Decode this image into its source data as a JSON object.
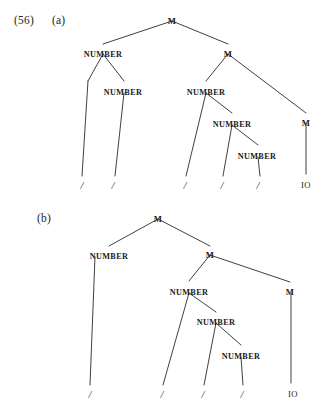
{
  "figure": {
    "example_number": "(56)",
    "background_color": "#ffffff",
    "ink_color": "#2b2b2b"
  },
  "trees": [
    {
      "label": "(a)",
      "label_pos": {
        "x": 52,
        "y": 14
      },
      "nodes": [
        {
          "name": "root-m",
          "text": "M",
          "x": 172,
          "y": 17
        },
        {
          "name": "number-1",
          "text": "NUMBER",
          "x": 103,
          "y": 50
        },
        {
          "name": "m-2",
          "text": "M",
          "x": 228,
          "y": 50
        },
        {
          "name": "number-2",
          "text": "NUMBER",
          "x": 123,
          "y": 88
        },
        {
          "name": "number-3",
          "text": "NUMBER",
          "x": 206,
          "y": 88
        },
        {
          "name": "m-3",
          "text": "M",
          "x": 306,
          "y": 119
        },
        {
          "name": "number-4",
          "text": "NUMBER",
          "x": 232,
          "y": 120
        },
        {
          "name": "number-5",
          "text": "NUMBER",
          "x": 257,
          "y": 152
        }
      ],
      "terminals": [
        {
          "name": "terminal-slash-1",
          "text": "/",
          "x": 82,
          "y": 180
        },
        {
          "name": "terminal-slash-2",
          "text": "/",
          "x": 113,
          "y": 180
        },
        {
          "name": "terminal-slash-3",
          "text": "/",
          "x": 185,
          "y": 180
        },
        {
          "name": "terminal-slash-4",
          "text": "/",
          "x": 222,
          "y": 180
        },
        {
          "name": "terminal-slash-5",
          "text": "/",
          "x": 258,
          "y": 180
        },
        {
          "name": "terminal-io",
          "text": "IO",
          "x": 306,
          "y": 180
        }
      ],
      "edges": [
        {
          "x1": 172,
          "y1": 21,
          "x2": 103,
          "y2": 44
        },
        {
          "x1": 172,
          "y1": 21,
          "x2": 228,
          "y2": 44
        },
        {
          "x1": 103,
          "y1": 54,
          "x2": 88,
          "y2": 81
        },
        {
          "x1": 103,
          "y1": 54,
          "x2": 124,
          "y2": 81
        },
        {
          "x1": 88,
          "y1": 81,
          "x2": 82,
          "y2": 176
        },
        {
          "x1": 124,
          "y1": 93,
          "x2": 115,
          "y2": 176
        },
        {
          "x1": 228,
          "y1": 54,
          "x2": 206,
          "y2": 81
        },
        {
          "x1": 228,
          "y1": 54,
          "x2": 306,
          "y2": 113
        },
        {
          "x1": 206,
          "y1": 93,
          "x2": 186,
          "y2": 176
        },
        {
          "x1": 206,
          "y1": 93,
          "x2": 232,
          "y2": 113
        },
        {
          "x1": 232,
          "y1": 125,
          "x2": 223,
          "y2": 176
        },
        {
          "x1": 232,
          "y1": 125,
          "x2": 258,
          "y2": 145
        },
        {
          "x1": 258,
          "y1": 157,
          "x2": 260,
          "y2": 176
        },
        {
          "x1": 306,
          "y1": 123,
          "x2": 306,
          "y2": 174
        }
      ]
    },
    {
      "label": "(b)",
      "label_pos": {
        "x": 37,
        "y": 212
      },
      "nodes": [
        {
          "name": "root-m",
          "text": "M",
          "x": 158,
          "y": 215
        },
        {
          "name": "number-1",
          "text": "NUMBER",
          "x": 109,
          "y": 252
        },
        {
          "name": "m-2",
          "text": "M",
          "x": 210,
          "y": 251
        },
        {
          "name": "number-2",
          "text": "NUMBER",
          "x": 189,
          "y": 288
        },
        {
          "name": "m-3",
          "text": "M",
          "x": 290,
          "y": 288
        },
        {
          "name": "number-3",
          "text": "NUMBER",
          "x": 216,
          "y": 318
        },
        {
          "name": "number-4",
          "text": "NUMBER",
          "x": 241,
          "y": 352
        }
      ],
      "terminals": [
        {
          "name": "terminal-slash-1",
          "text": "/",
          "x": 90,
          "y": 389
        },
        {
          "name": "terminal-slash-2",
          "text": "/",
          "x": 162,
          "y": 389
        },
        {
          "name": "terminal-slash-3",
          "text": "/",
          "x": 203,
          "y": 389
        },
        {
          "name": "terminal-slash-4",
          "text": "/",
          "x": 242,
          "y": 389
        },
        {
          "name": "terminal-io",
          "text": "IO",
          "x": 293,
          "y": 389
        }
      ],
      "edges": [
        {
          "x1": 158,
          "y1": 219,
          "x2": 109,
          "y2": 246
        },
        {
          "x1": 158,
          "y1": 219,
          "x2": 210,
          "y2": 246
        },
        {
          "x1": 95,
          "y1": 257,
          "x2": 90,
          "y2": 385
        },
        {
          "x1": 210,
          "y1": 255,
          "x2": 189,
          "y2": 281
        },
        {
          "x1": 210,
          "y1": 255,
          "x2": 290,
          "y2": 282
        },
        {
          "x1": 189,
          "y1": 293,
          "x2": 163,
          "y2": 385
        },
        {
          "x1": 189,
          "y1": 293,
          "x2": 216,
          "y2": 312
        },
        {
          "x1": 216,
          "y1": 323,
          "x2": 204,
          "y2": 385
        },
        {
          "x1": 216,
          "y1": 323,
          "x2": 241,
          "y2": 345
        },
        {
          "x1": 241,
          "y1": 357,
          "x2": 243,
          "y2": 385
        },
        {
          "x1": 291,
          "y1": 293,
          "x2": 291,
          "y2": 383
        }
      ]
    }
  ]
}
